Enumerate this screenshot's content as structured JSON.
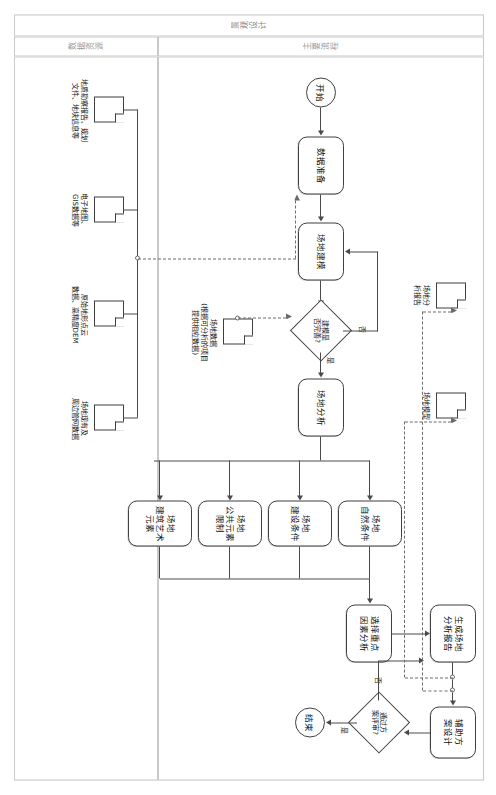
{
  "diagram": {
    "type": "flowchart",
    "orientation_note": "rotated",
    "pool_title": "景观设计",
    "lanes": [
      {
        "id": "main",
        "title": "主要流程"
      },
      {
        "id": "data",
        "title": "数据资源"
      }
    ]
  },
  "nodes": {
    "start": {
      "label": "开始",
      "shape": "start-event"
    },
    "data_prep": {
      "label": "数据准备",
      "shape": "task"
    },
    "site_model": {
      "label": "场地建模",
      "shape": "task"
    },
    "model_check": {
      "label": "建模是\n否完善?",
      "shape": "gateway"
    },
    "site_analysis": {
      "label": "场地分析",
      "shape": "task"
    },
    "f1": {
      "label": "场地\n自然条件",
      "shape": "task"
    },
    "f2": {
      "label": "场地\n建设条件",
      "shape": "task"
    },
    "f3": {
      "label": "场地\n公共元素限制",
      "shape": "task"
    },
    "f4": {
      "label": "场地\n建筑艺术元素",
      "shape": "task"
    },
    "key_factor": {
      "label": "选择重点\n因素分析",
      "shape": "task"
    },
    "gen_report": {
      "label": "生成场地\n分析报告",
      "shape": "task"
    },
    "assist_design": {
      "label": "辅助方\n案设计",
      "shape": "task"
    },
    "review": {
      "label": "通过方\n案评审?",
      "shape": "gateway"
    },
    "end": {
      "label": "结束",
      "shape": "end-event"
    }
  },
  "edge_labels": {
    "model_yes": "是",
    "model_no": "否",
    "review_yes": "是",
    "review_no": "否"
  },
  "data_objects": [
    {
      "id": "doc_geo",
      "label": "地质勘察报告、规划\n文件、地块信息等"
    },
    {
      "id": "doc_map",
      "label": "电子地图、\nGIS数据等"
    },
    {
      "id": "doc_dem",
      "label": "原始地形点云\n数据、高精度DEM"
    },
    {
      "id": "doc_pipe",
      "label": "场地现有及\n周边管网数据"
    },
    {
      "id": "doc_site",
      "label": "场地数据\n(根据可分析的项目\n提供相应数据)"
    },
    {
      "id": "doc_model",
      "label": "场地模型"
    },
    {
      "id": "doc_rep",
      "label": "场地分\n析报告"
    }
  ],
  "colors": {
    "stroke": "#3f3f3f",
    "connector": "#4a4a4a",
    "dashed": "#6b6b6b",
    "frame": "#c9c9c9",
    "lane_text": "#9a9a9a",
    "background": "#ffffff"
  }
}
